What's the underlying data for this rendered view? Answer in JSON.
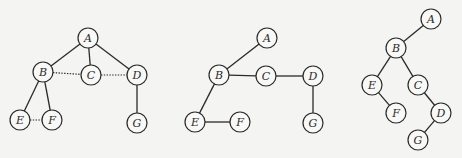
{
  "diagram": {
    "node_radius": 10,
    "graphs": [
      {
        "name": "graph-original",
        "nodes": [
          {
            "id": "A",
            "label": "A",
            "x": 88,
            "y": 38
          },
          {
            "id": "B",
            "label": "B",
            "x": 43,
            "y": 72
          },
          {
            "id": "C",
            "label": "C",
            "x": 91,
            "y": 75
          },
          {
            "id": "D",
            "label": "D",
            "x": 137,
            "y": 75
          },
          {
            "id": "E",
            "label": "E",
            "x": 20,
            "y": 120
          },
          {
            "id": "F",
            "label": "F",
            "x": 52,
            "y": 120
          },
          {
            "id": "G",
            "label": "G",
            "x": 137,
            "y": 123
          }
        ],
        "edges": [
          {
            "from": "A",
            "to": "B",
            "style": "solid"
          },
          {
            "from": "A",
            "to": "C",
            "style": "solid"
          },
          {
            "from": "A",
            "to": "D",
            "style": "solid"
          },
          {
            "from": "B",
            "to": "E",
            "style": "solid"
          },
          {
            "from": "B",
            "to": "F",
            "style": "solid"
          },
          {
            "from": "D",
            "to": "G",
            "style": "solid"
          },
          {
            "from": "B",
            "to": "C",
            "style": "dotted"
          },
          {
            "from": "C",
            "to": "D",
            "style": "dotted"
          },
          {
            "from": "E",
            "to": "F",
            "style": "dotted"
          }
        ]
      },
      {
        "name": "graph-transformed",
        "nodes": [
          {
            "id": "A",
            "label": "A",
            "x": 267,
            "y": 38
          },
          {
            "id": "B",
            "label": "B",
            "x": 219,
            "y": 75
          },
          {
            "id": "C",
            "label": "C",
            "x": 266,
            "y": 76
          },
          {
            "id": "D",
            "label": "D",
            "x": 313,
            "y": 76
          },
          {
            "id": "E",
            "label": "E",
            "x": 195,
            "y": 122
          },
          {
            "id": "F",
            "label": "F",
            "x": 240,
            "y": 122
          },
          {
            "id": "G",
            "label": "G",
            "x": 313,
            "y": 123
          }
        ],
        "edges": [
          {
            "from": "A",
            "to": "B",
            "style": "solid"
          },
          {
            "from": "B",
            "to": "C",
            "style": "solid"
          },
          {
            "from": "C",
            "to": "D",
            "style": "solid"
          },
          {
            "from": "B",
            "to": "E",
            "style": "solid"
          },
          {
            "from": "E",
            "to": "F",
            "style": "solid"
          },
          {
            "from": "D",
            "to": "G",
            "style": "solid"
          }
        ]
      },
      {
        "name": "graph-binary-tree",
        "nodes": [
          {
            "id": "A",
            "label": "A",
            "x": 431,
            "y": 19
          },
          {
            "id": "B",
            "label": "B",
            "x": 396,
            "y": 48
          },
          {
            "id": "E",
            "label": "E",
            "x": 372,
            "y": 85
          },
          {
            "id": "C",
            "label": "C",
            "x": 418,
            "y": 85
          },
          {
            "id": "F",
            "label": "F",
            "x": 396,
            "y": 113
          },
          {
            "id": "D",
            "label": "D",
            "x": 441,
            "y": 113
          },
          {
            "id": "G",
            "label": "G",
            "x": 418,
            "y": 140
          }
        ],
        "edges": [
          {
            "from": "A",
            "to": "B",
            "style": "solid"
          },
          {
            "from": "B",
            "to": "E",
            "style": "solid"
          },
          {
            "from": "B",
            "to": "C",
            "style": "solid"
          },
          {
            "from": "E",
            "to": "F",
            "style": "solid"
          },
          {
            "from": "C",
            "to": "D",
            "style": "solid"
          },
          {
            "from": "D",
            "to": "G",
            "style": "solid"
          }
        ]
      }
    ]
  }
}
